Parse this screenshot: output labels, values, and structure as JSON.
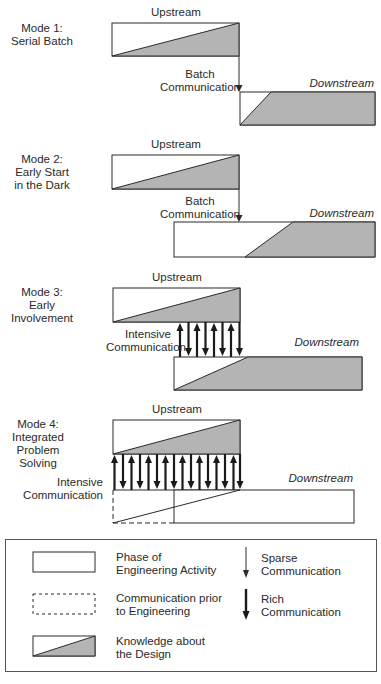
{
  "colors": {
    "fill_gray": "#b4b4b4",
    "stroke": "#2a2a2a",
    "background": "#ffffff"
  },
  "modes": [
    {
      "title_lines": [
        "Mode 1:",
        "Serial Batch"
      ],
      "upstream_label": "Upstream",
      "downstream_label": "Downstream",
      "communication_lines": [
        "Batch",
        "Communication"
      ],
      "communication_type": "sparse"
    },
    {
      "title_lines": [
        "Mode 2:",
        "Early Start",
        "in the Dark"
      ],
      "upstream_label": "Upstream",
      "downstream_label": "Downstream",
      "communication_lines": [
        "Batch",
        "Communication"
      ],
      "communication_type": "sparse"
    },
    {
      "title_lines": [
        "Mode 3:",
        "Early",
        "Involvement"
      ],
      "upstream_label": "Upstream",
      "downstream_label": "Downstream",
      "communication_lines": [
        "Intensive",
        "Communication"
      ],
      "communication_type": "rich",
      "arrow_count": 8
    },
    {
      "title_lines": [
        "Mode 4:",
        "Integrated",
        "Problem",
        "Solving"
      ],
      "upstream_label": "Upstream",
      "downstream_label": "Downstream",
      "communication_lines": [
        "Intensive",
        "Communication"
      ],
      "communication_type": "rich",
      "arrow_count": 16
    }
  ],
  "legend": {
    "items": [
      {
        "symbol": "solid-box",
        "lines": [
          "Phase of",
          "Engineering Activity"
        ]
      },
      {
        "symbol": "dashed-box",
        "lines": [
          "Communication prior",
          "to Engineering"
        ]
      },
      {
        "symbol": "knowledge-box",
        "lines": [
          "Knowledge about",
          "the Design"
        ]
      },
      {
        "symbol": "thin-arrow",
        "lines": [
          "Sparse",
          "Communication"
        ]
      },
      {
        "symbol": "thick-arrow",
        "lines": [
          "Rich",
          "Communication"
        ]
      }
    ]
  }
}
